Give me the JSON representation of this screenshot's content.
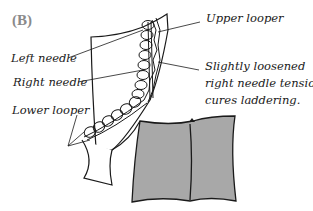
{
  "panel_label": "(B)",
  "labels": {
    "upper_looper": "Upper looper",
    "left_needle": "Left needle",
    "right_needle": "Right needle",
    "lower_looper": "Lower looper",
    "note_line1": "Slightly loosened",
    "note_line2": "right needle tension",
    "note_line3": "cures laddering."
  },
  "colors": {
    "ink": "#1a1a1a",
    "fabric_fill": "#a8a8a8",
    "panel_label": "#8a8a8a"
  }
}
